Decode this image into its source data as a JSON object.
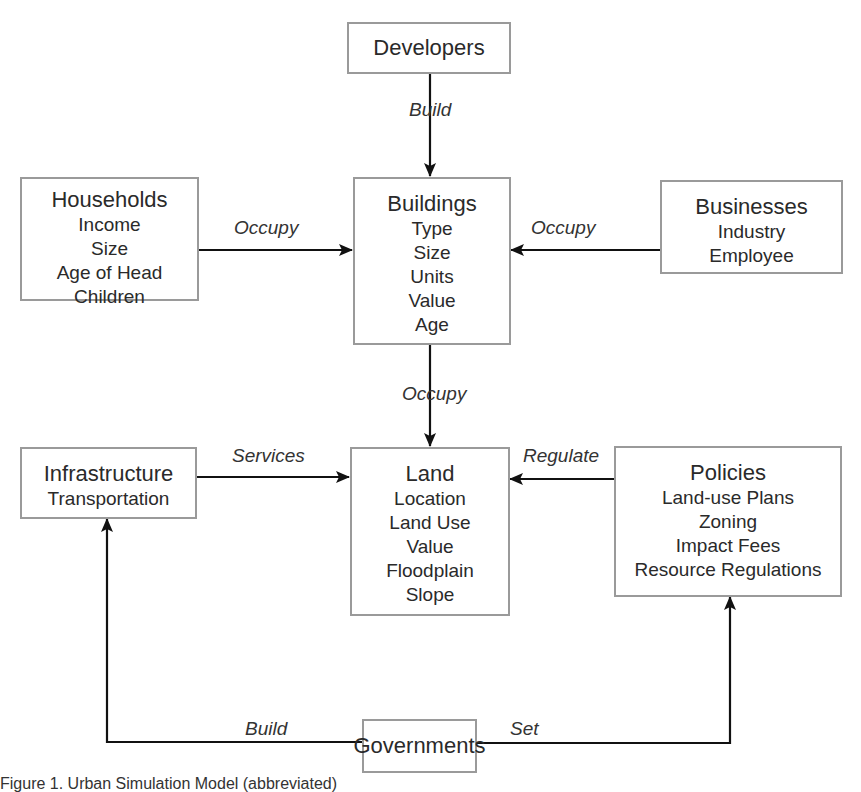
{
  "diagram": {
    "nodes": {
      "developers": {
        "title": "Developers",
        "attributes": []
      },
      "households": {
        "title": "Households",
        "attributes": [
          "Income",
          "Size",
          "Age of Head",
          "Children"
        ]
      },
      "buildings": {
        "title": "Buildings",
        "attributes": [
          "Type",
          "Size",
          "Units",
          "Value",
          "Age"
        ]
      },
      "businesses": {
        "title": "Businesses",
        "attributes": [
          "Industry",
          "Employee"
        ]
      },
      "infrastructure": {
        "title": "Infrastructure",
        "attributes": [
          "Transportation"
        ]
      },
      "land": {
        "title": "Land",
        "attributes": [
          "Location",
          "Land Use",
          "Value",
          "Floodplain",
          "Slope"
        ]
      },
      "policies": {
        "title": "Policies",
        "attributes": [
          "Land-use Plans",
          "Zoning",
          "Impact Fees",
          "Resource Regulations"
        ]
      },
      "governments": {
        "title": "Governments",
        "attributes": []
      }
    },
    "edges": {
      "developers_buildings": {
        "from": "Developers",
        "to": "Buildings",
        "label": "Build"
      },
      "households_buildings": {
        "from": "Households",
        "to": "Buildings",
        "label": "Occupy"
      },
      "businesses_buildings": {
        "from": "Businesses",
        "to": "Buildings",
        "label": "Occupy"
      },
      "buildings_land": {
        "from": "Buildings",
        "to": "Land",
        "label": "Occupy"
      },
      "infrastructure_land": {
        "from": "Infrastructure",
        "to": "Land",
        "label": "Services"
      },
      "policies_land": {
        "from": "Policies",
        "to": "Land",
        "label": "Regulate"
      },
      "governments_infrastructure": {
        "from": "Governments",
        "to": "Infrastructure",
        "label": "Build"
      },
      "governments_policies": {
        "from": "Governments",
        "to": "Policies",
        "label": "Set"
      }
    }
  },
  "caption": "Figure 1. Urban Simulation Model (abbreviated)",
  "colors": {
    "box_border": "#9a9a9a",
    "arrow": "#111111",
    "text": "#2a2a2a"
  }
}
